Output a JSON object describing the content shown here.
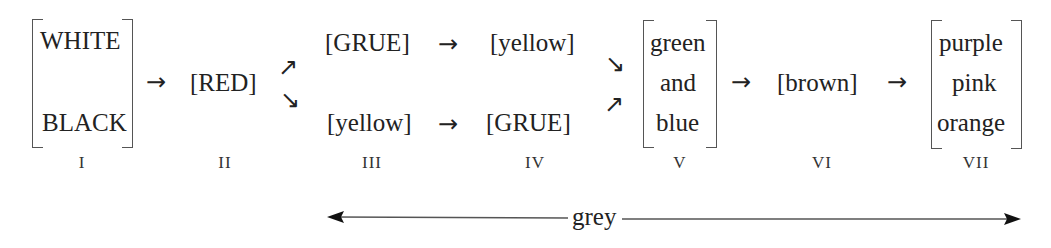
{
  "diagram": {
    "type": "evolutionary sequence of basic color terms",
    "stages": [
      {
        "numeral": "I",
        "terms": [
          "WHITE",
          "BLACK"
        ],
        "bracketed_group": true
      },
      {
        "numeral": "II",
        "terms": [
          "[RED]"
        ]
      },
      {
        "numeral": "III",
        "terms": [
          "[GRUE]",
          "[yellow]"
        ],
        "branching": "splits from II into two paths"
      },
      {
        "numeral": "IV",
        "terms": [
          "[yellow]",
          "[GRUE]"
        ]
      },
      {
        "numeral": "V",
        "terms": [
          "green",
          "and",
          "blue"
        ],
        "bracketed_group": true,
        "branching": "merges both paths"
      },
      {
        "numeral": "VI",
        "terms": [
          "[brown]"
        ]
      },
      {
        "numeral": "VII",
        "terms": [
          "purple",
          "pink",
          "orange"
        ],
        "bracketed_group": true
      }
    ],
    "paths": {
      "upper": [
        "[GRUE]",
        "→",
        "[yellow]"
      ],
      "lower": [
        "[yellow]",
        "→",
        "[GRUE]"
      ]
    },
    "arrow_glyph": "→",
    "split_up_glyph": "↗",
    "split_down_glyph": "↘",
    "span": {
      "label": "grey",
      "from_stage": "III",
      "to_stage": "VII",
      "style": "double-headed arrow"
    }
  }
}
